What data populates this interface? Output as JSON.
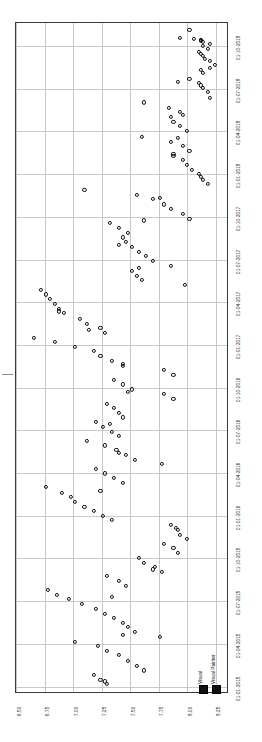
{
  "chart_data": {
    "type": "scatter",
    "title": "",
    "subtitle": "",
    "orientation": "rotated-90",
    "xlabel": "",
    "ylabel": "",
    "grid": true,
    "legend_position": "bottom-right",
    "value_axis": {
      "name": "value",
      "ticks": [
        "6.50",
        "6.75",
        "7.00",
        "7.25",
        "7.50",
        "7.75",
        "8.00",
        "8.25"
      ],
      "range": [
        6.5,
        8.35
      ]
    },
    "date_axis": {
      "name": "date",
      "ticks": [
        "01-10-2018",
        "01-07-2018",
        "01-04-2018",
        "01-01-2018",
        "01-10-2017",
        "01-07-2017",
        "01-04-2017",
        "01-01-2017",
        "01-10-2016",
        "01-07-2016",
        "01-04-2016",
        "01-01-2016",
        "01-10-2015",
        "01-07-2015",
        "01-04-2015",
        "01-01-2015"
      ],
      "range": [
        "01-01-2015",
        "01-10-2018"
      ]
    },
    "series": [
      {
        "name": "Visual",
        "marker": "open-circle",
        "color": "#111111",
        "points": [
          [
            8.02,
            "2018-11-05"
          ],
          [
            7.94,
            "2018-10-18"
          ],
          [
            8.06,
            "2018-10-16"
          ],
          [
            8.12,
            "2018-10-15"
          ],
          [
            8.12,
            "2018-10-12"
          ],
          [
            8.14,
            "2018-10-09"
          ],
          [
            8.2,
            "2018-10-06"
          ],
          [
            8.14,
            "2018-10-02"
          ],
          [
            8.1,
            "2018-09-20"
          ],
          [
            8.12,
            "2018-09-14"
          ],
          [
            8.14,
            "2018-09-10"
          ],
          [
            8.16,
            "2018-09-04"
          ],
          [
            8.2,
            "2018-08-30"
          ],
          [
            8.24,
            "2018-08-22"
          ],
          [
            8.12,
            "2018-08-11"
          ],
          [
            8.14,
            "2018-08-05"
          ],
          [
            8.02,
            "2018-07-22"
          ],
          [
            8.1,
            "2018-07-14"
          ],
          [
            8.12,
            "2018-07-08"
          ],
          [
            8.14,
            "2018-07-02"
          ],
          [
            8.18,
            "2018-06-24"
          ],
          [
            8.2,
            "2018-06-12"
          ],
          [
            7.62,
            "2018-06-02"
          ],
          [
            7.84,
            "2018-05-21"
          ],
          [
            7.94,
            "2018-05-12"
          ],
          [
            7.86,
            "2018-05-02"
          ],
          [
            7.88,
            "2018-04-22"
          ],
          [
            7.94,
            "2018-04-12"
          ],
          [
            8.0,
            "2018-04-02"
          ],
          [
            7.6,
            "2018-03-20"
          ],
          [
            7.86,
            "2018-03-10"
          ],
          [
            7.96,
            "2018-03-01"
          ],
          [
            8.02,
            "2018-02-20"
          ],
          [
            7.88,
            "2018-02-10"
          ],
          [
            7.96,
            "2018-02-01"
          ],
          [
            8.0,
            "2018-01-20"
          ],
          [
            8.04,
            "2018-01-10"
          ],
          [
            8.1,
            "2018-01-02"
          ],
          [
            8.14,
            "2017-12-20"
          ],
          [
            8.18,
            "2017-12-10"
          ],
          [
            7.1,
            "2017-11-28"
          ],
          [
            7.56,
            "2017-11-18"
          ],
          [
            7.7,
            "2017-11-08"
          ],
          [
            7.8,
            "2017-10-28"
          ],
          [
            7.86,
            "2017-10-18"
          ],
          [
            7.96,
            "2017-10-08"
          ],
          [
            8.02,
            "2017-09-28"
          ],
          [
            7.32,
            "2017-09-18"
          ],
          [
            7.4,
            "2017-09-08"
          ],
          [
            7.48,
            "2017-08-28"
          ],
          [
            7.44,
            "2017-08-18"
          ],
          [
            7.46,
            "2017-08-08"
          ],
          [
            7.52,
            "2017-07-28"
          ],
          [
            7.58,
            "2017-07-18"
          ],
          [
            7.64,
            "2017-07-08"
          ],
          [
            7.7,
            "2017-06-28"
          ],
          [
            7.86,
            "2017-06-18"
          ],
          [
            7.52,
            "2017-06-08"
          ],
          [
            7.56,
            "2017-05-28"
          ],
          [
            7.6,
            "2017-05-18"
          ],
          [
            7.98,
            "2017-05-08"
          ],
          [
            6.72,
            "2017-04-28"
          ],
          [
            6.76,
            "2017-04-18"
          ],
          [
            6.8,
            "2017-04-08"
          ],
          [
            6.84,
            "2017-03-28"
          ],
          [
            6.88,
            "2017-03-18"
          ],
          [
            6.92,
            "2017-03-08"
          ],
          [
            7.06,
            "2017-02-26"
          ],
          [
            7.12,
            "2017-02-16"
          ],
          [
            7.24,
            "2017-02-06"
          ],
          [
            7.28,
            "2017-01-27"
          ],
          [
            6.66,
            "2017-01-17"
          ],
          [
            6.84,
            "2017-01-07"
          ],
          [
            7.02,
            "2016-12-28"
          ],
          [
            7.18,
            "2016-12-18"
          ],
          [
            7.24,
            "2016-12-08"
          ],
          [
            7.34,
            "2016-11-28"
          ],
          [
            7.44,
            "2016-11-18"
          ],
          [
            7.8,
            "2016-11-08"
          ],
          [
            7.88,
            "2016-10-28"
          ],
          [
            7.36,
            "2016-10-18"
          ],
          [
            7.44,
            "2016-10-08"
          ],
          [
            7.52,
            "2016-09-28"
          ],
          [
            7.8,
            "2016-09-18"
          ],
          [
            7.88,
            "2016-09-08"
          ],
          [
            7.3,
            "2016-08-28"
          ],
          [
            7.36,
            "2016-08-18"
          ],
          [
            7.4,
            "2016-08-08"
          ],
          [
            7.44,
            "2016-07-29"
          ],
          [
            7.2,
            "2016-07-19"
          ],
          [
            7.26,
            "2016-07-09"
          ],
          [
            7.34,
            "2016-06-29"
          ],
          [
            7.4,
            "2016-06-19"
          ],
          [
            7.12,
            "2016-06-09"
          ],
          [
            7.28,
            "2016-05-30"
          ],
          [
            7.38,
            "2016-05-20"
          ],
          [
            7.46,
            "2016-05-10"
          ],
          [
            7.54,
            "2016-04-30"
          ],
          [
            7.78,
            "2016-04-20"
          ],
          [
            7.2,
            "2016-04-10"
          ],
          [
            7.28,
            "2016-03-31"
          ],
          [
            7.36,
            "2016-03-21"
          ],
          [
            7.44,
            "2016-03-11"
          ],
          [
            6.76,
            "2016-03-01"
          ],
          [
            6.9,
            "2016-02-20"
          ],
          [
            6.98,
            "2016-02-10"
          ],
          [
            7.02,
            "2016-01-31"
          ],
          [
            7.1,
            "2016-01-21"
          ],
          [
            7.18,
            "2016-01-11"
          ],
          [
            7.26,
            "2016-01-01"
          ],
          [
            7.34,
            "2015-12-22"
          ],
          [
            7.86,
            "2015-12-12"
          ],
          [
            7.92,
            "2015-12-02"
          ],
          [
            7.94,
            "2015-11-22"
          ],
          [
            8.0,
            "2015-11-12"
          ],
          [
            7.8,
            "2015-11-02"
          ],
          [
            7.88,
            "2015-10-23"
          ],
          [
            7.92,
            "2015-10-13"
          ],
          [
            7.58,
            "2015-10-03"
          ],
          [
            7.62,
            "2015-09-23"
          ],
          [
            7.72,
            "2015-09-13"
          ],
          [
            7.78,
            "2015-09-03"
          ],
          [
            7.3,
            "2015-08-24"
          ],
          [
            7.4,
            "2015-08-14"
          ],
          [
            7.46,
            "2015-08-04"
          ],
          [
            6.78,
            "2015-07-25"
          ],
          [
            6.86,
            "2015-07-15"
          ],
          [
            6.96,
            "2015-07-05"
          ],
          [
            7.08,
            "2015-06-25"
          ],
          [
            7.2,
            "2015-06-15"
          ],
          [
            7.28,
            "2015-06-05"
          ],
          [
            7.36,
            "2015-05-26"
          ],
          [
            7.44,
            "2015-05-16"
          ],
          [
            7.48,
            "2015-05-06"
          ],
          [
            7.54,
            "2015-04-26"
          ],
          [
            7.76,
            "2015-04-16"
          ],
          [
            7.02,
            "2015-04-06"
          ],
          [
            7.22,
            "2015-03-27"
          ],
          [
            7.3,
            "2015-03-17"
          ],
          [
            7.4,
            "2015-03-07"
          ],
          [
            7.48,
            "2015-02-25"
          ],
          [
            7.56,
            "2015-02-15"
          ],
          [
            7.62,
            "2015-02-05"
          ],
          [
            7.18,
            "2015-01-26"
          ],
          [
            7.24,
            "2015-01-16"
          ],
          [
            7.3,
            "2015-01-06"
          ]
        ]
      },
      {
        "name": "Visual Painter",
        "marker": "open-circle",
        "color": "#111111",
        "points": [
          [
            8.12,
            "2018-10-14"
          ],
          [
            8.18,
            "2018-09-26"
          ],
          [
            8.2,
            "2018-08-16"
          ],
          [
            7.92,
            "2018-07-16"
          ],
          [
            7.96,
            "2018-05-06"
          ],
          [
            7.92,
            "2018-03-18"
          ],
          [
            7.88,
            "2018-02-14"
          ],
          [
            8.12,
            "2017-12-26"
          ],
          [
            7.76,
            "2017-11-12"
          ],
          [
            7.62,
            "2017-09-24"
          ],
          [
            7.4,
            "2017-08-02"
          ],
          [
            7.58,
            "2017-06-14"
          ],
          [
            6.88,
            "2017-03-12"
          ],
          [
            7.14,
            "2017-02-02"
          ],
          [
            7.44,
            "2016-11-22"
          ],
          [
            7.48,
            "2016-09-22"
          ],
          [
            7.32,
            "2016-07-14"
          ],
          [
            7.4,
            "2016-05-14"
          ],
          [
            7.24,
            "2016-02-24"
          ],
          [
            7.9,
            "2015-12-06"
          ],
          [
            7.7,
            "2015-09-08"
          ],
          [
            7.34,
            "2015-07-10"
          ],
          [
            7.44,
            "2015-04-20"
          ],
          [
            7.28,
            "2015-01-12"
          ]
        ]
      }
    ]
  },
  "axes": {
    "value_ticks": [
      "6.50",
      "6.75",
      "7.00",
      "7.25",
      "7.50",
      "7.75",
      "8.00",
      "8.25"
    ],
    "date_ticks": [
      "01-10-2018",
      "01-07-2018",
      "01-04-2018",
      "01-01-2018",
      "01-10-2017",
      "01-07-2017",
      "01-04-2017",
      "01-01-2017",
      "01-10-2016",
      "01-07-2016",
      "01-04-2016",
      "01-01-2016",
      "01-10-2015",
      "01-07-2015",
      "01-04-2015",
      "01-01-2015"
    ]
  },
  "legend": {
    "items": [
      {
        "label": "Visual",
        "color": "#111111"
      },
      {
        "label": "Visual Painter",
        "color": "#111111"
      }
    ]
  },
  "colors": {
    "frame": "#3a3a3a",
    "grid": "#c9c9c9",
    "marker": "#111111",
    "background": "#ffffff"
  }
}
